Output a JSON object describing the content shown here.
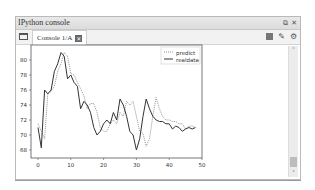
{
  "window": {
    "title": "IPython console",
    "controls": {
      "float": "⧉",
      "close": "✕"
    }
  },
  "tabs": [
    {
      "label": "Console 1/A",
      "close": "✕"
    }
  ],
  "toolbar": {
    "icons": [
      "stop-icon",
      "eraser-icon",
      "options-gear-icon"
    ]
  },
  "scrollbar": {
    "up": "˄",
    "down": "˅"
  },
  "colors": {
    "predict": "#888888",
    "realdata": "#333333",
    "axis": "#555555"
  },
  "chart_data": {
    "type": "line",
    "title": "",
    "xlabel": "",
    "ylabel": "",
    "xlim": [
      -2,
      50
    ],
    "ylim": [
      67.5,
      81.5
    ],
    "xticks": [
      0,
      10,
      20,
      30,
      40,
      50
    ],
    "yticks": [
      68,
      70,
      72,
      74,
      76,
      78,
      80
    ],
    "grid": false,
    "legend": {
      "position": "upper right",
      "entries": [
        "predict",
        "realdata"
      ]
    },
    "x": [
      0,
      1,
      2,
      3,
      4,
      5,
      6,
      7,
      8,
      9,
      10,
      11,
      12,
      13,
      14,
      15,
      16,
      17,
      18,
      19,
      20,
      21,
      22,
      23,
      24,
      25,
      26,
      27,
      28,
      29,
      30,
      31,
      32,
      33,
      34,
      35,
      36,
      37,
      38,
      39,
      40,
      41,
      42,
      43,
      44,
      45,
      46,
      47,
      48
    ],
    "series": [
      {
        "name": "predict",
        "style": "dotted",
        "values": [
          71.5,
          70.5,
          69.5,
          75.5,
          75.8,
          76.5,
          78.5,
          79.5,
          81.0,
          80.5,
          78.2,
          78.0,
          77.0,
          76.2,
          75.2,
          73.5,
          74.2,
          74.2,
          73.0,
          71.0,
          70.5,
          70.5,
          71.5,
          72.0,
          71.5,
          73.0,
          72.5,
          74.5,
          74.0,
          74.5,
          72.5,
          70.5,
          70.2,
          68.5,
          69.5,
          72.5,
          75.0,
          73.5,
          72.5,
          72.0,
          72.0,
          71.8,
          71.8,
          71.5,
          71.5,
          70.8,
          71.2,
          71.2,
          71.0
        ]
      },
      {
        "name": "realdata",
        "style": "solid",
        "values": [
          71.0,
          68.3,
          76.0,
          75.5,
          76.0,
          78.5,
          79.5,
          81.0,
          80.5,
          77.5,
          78.0,
          77.0,
          76.5,
          73.5,
          74.5,
          74.0,
          73.0,
          71.0,
          70.0,
          70.5,
          71.5,
          72.0,
          71.5,
          73.0,
          72.0,
          74.8,
          74.0,
          72.5,
          70.5,
          70.0,
          68.0,
          69.5,
          72.5,
          74.8,
          73.5,
          72.5,
          72.0,
          71.8,
          71.8,
          71.5,
          71.5,
          70.8,
          71.2,
          71.0,
          70.5,
          70.8,
          71.0,
          70.8,
          71.0
        ]
      }
    ]
  }
}
